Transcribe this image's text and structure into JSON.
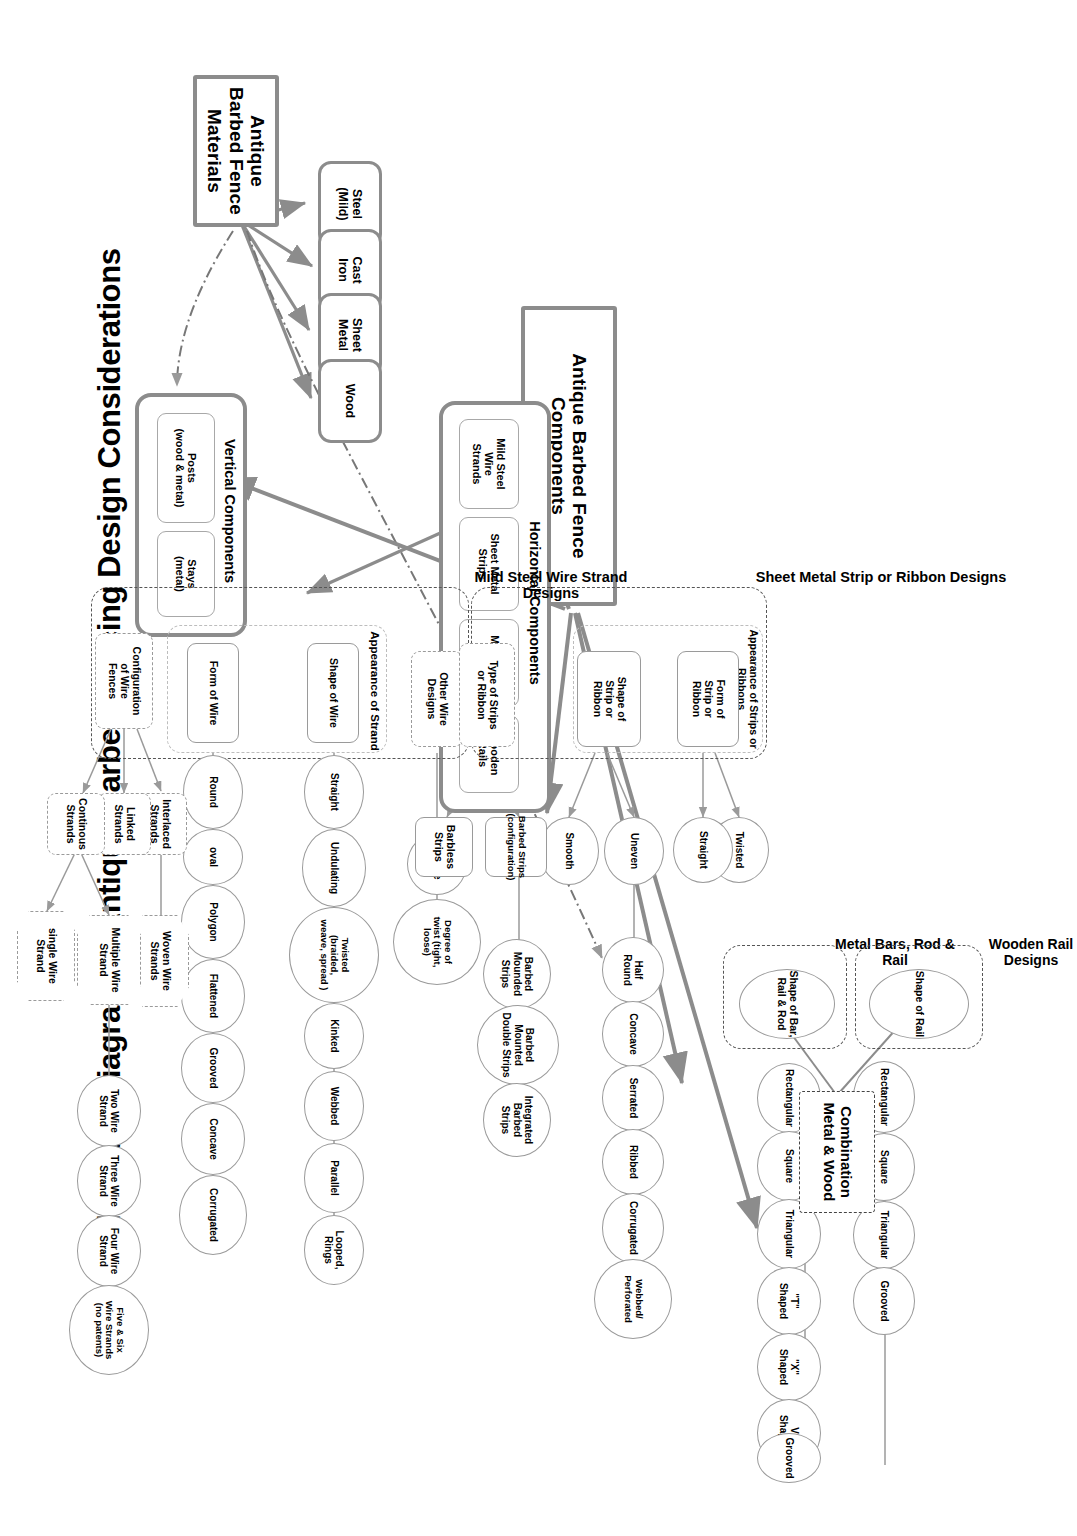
{
  "title": "Schematic Diagram of Antique Barbed Fencing Design Considerations",
  "roots": {
    "components": "Antique Barbed Fence Components",
    "materials": "Antique Barbed Fence Materials"
  },
  "materials": {
    "items": [
      {
        "label": "Steel\n(Mild)"
      },
      {
        "label": "Cast\nIron"
      },
      {
        "label": "Sheet\nMetal"
      },
      {
        "label": "Wood"
      }
    ]
  },
  "vertical_components": {
    "label": "Vertical Components",
    "items": [
      {
        "label": "Posts\n(wood & metal)"
      },
      {
        "label": "Stays\n(metal)"
      }
    ]
  },
  "horizontal_components": {
    "label": "Horizontal Components",
    "items": [
      {
        "label": "Mild Steel\nWire\nStrands"
      },
      {
        "label": "Sheet Metal\nStrips"
      },
      {
        "label": "Metal Bars\n& Rods"
      },
      {
        "label": "Wooden\nRails"
      }
    ]
  },
  "wire_strand_designs": {
    "group_label": "Mild Steel Wire Strand Designs",
    "appearance_label": "Appearance of Strand",
    "shape_of_wire": {
      "label": "Shape of Wire",
      "children": [
        "Round",
        "oval",
        "Polygon",
        "Flattened",
        "Grooved",
        "Concave",
        "Corrugated"
      ]
    },
    "form_of_wire": {
      "label": "Form of Wire",
      "children": [
        "Straight",
        "Undulating",
        "Twisted\n(braided,\nweave, spread )",
        "Kinked",
        "Webbed",
        "Parallel",
        "Looped,\nRings"
      ]
    },
    "other_wire_designs": {
      "label": "Other Wire\nDesigns",
      "children": [
        "Gauge",
        "Degree of\ntwist (tight,\nloose)"
      ]
    },
    "configuration": {
      "label": "Configuration\nof Wire\nFences",
      "branches": [
        {
          "label": "Interlaced\nStrands",
          "children": [
            "Woven Wire\nStrands"
          ]
        },
        {
          "label": "Linked\nStrands",
          "children": []
        },
        {
          "label": "Continous\nStrands",
          "children": [
            "Multiple Wire\nStrand",
            "single Wire\nStrand"
          ]
        }
      ],
      "multiple_children": [
        "Two Wire\nStrand",
        "Three Wire\nStrand",
        "Four Wire\nStrand",
        "Five & Six\nWire Strands\n(no patents)"
      ]
    }
  },
  "strip_ribbon_designs": {
    "group_label": "Sheet Metal Strip or Ribbon Designs",
    "appearance_label": "Appearance of Strips or Ribbons",
    "type_of_strips": {
      "label": "Type of Strips\nor Ribbon",
      "branches": [
        {
          "label": "Barbed Strips\n(configuration)",
          "children": [
            "Barbed\nMounded\nStrips",
            "Barbed\nMounted\nDouble Strips",
            "Integrated\nBarbed\nStrips"
          ]
        },
        {
          "label": "Barbless\nStrips",
          "children": []
        }
      ]
    },
    "shape_of_strip": {
      "label": "Shape of\nStrip or\nRibbon",
      "branches": [
        {
          "label": "Smooth",
          "children": []
        },
        {
          "label": "Uneven",
          "children": [
            "Half\nRound",
            "Concave",
            "Serrated",
            "Ribbed",
            "Corrugated",
            "Webbed/\nPerforated"
          ]
        }
      ]
    },
    "form_of_strip": {
      "label": "Form of\nStrip or\nRibbon",
      "branches": [
        {
          "label": "Straight",
          "children": []
        },
        {
          "label": "Twisted",
          "children": []
        }
      ]
    }
  },
  "metal_bars": {
    "group_label": "Metal Bars, Rod\n& Rail",
    "shape_label": "Shape of Bar,\nRail & Rod",
    "children": [
      "Rectangular",
      "Square",
      "Triangular",
      "\"T\"\nShaped",
      "\"X\"\nShaped",
      "V\"\nShaped",
      "Grooved"
    ]
  },
  "wooden_rail": {
    "group_label": "Wooden Rail\nDesigns",
    "shape_label": "Shape of Rail",
    "children": [
      "Rectangular",
      "Square",
      "Triangular",
      "Grooved"
    ]
  },
  "combination": {
    "label": "Combination\nMetal & Wood"
  },
  "colors": {
    "line_gray": "#8c8c8c",
    "thin_gray": "#9a9a9a",
    "dashdot": "#555555",
    "text": "#000000",
    "background": "#ffffff"
  }
}
